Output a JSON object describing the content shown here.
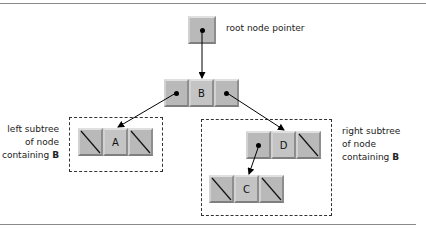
{
  "diagram": {
    "type": "binary-tree-linked-representation",
    "root_pointer": {
      "label": "root node pointer"
    },
    "nodes": {
      "B": {
        "value": "B",
        "left": "pointer",
        "right": "pointer"
      },
      "A": {
        "value": "A",
        "left": "null",
        "right": "null"
      },
      "D": {
        "value": "D",
        "left": "pointer",
        "right": "null"
      },
      "C": {
        "value": "C",
        "left": "null",
        "right": "null"
      }
    },
    "edges": [
      {
        "from": "root",
        "to": "B"
      },
      {
        "from": "B.left",
        "to": "A"
      },
      {
        "from": "B.right",
        "to": "D"
      },
      {
        "from": "D.left",
        "to": "C"
      }
    ],
    "left_subtree": {
      "line1": "left subtree",
      "line2": "of node",
      "line3_prefix": "containing ",
      "line3_bold": "B"
    },
    "right_subtree": {
      "line1": "right subtree",
      "line2": "of node",
      "line3_prefix": "containing ",
      "line3_bold": "B"
    }
  },
  "colors": {
    "cell": "#b9b9b9",
    "dashed_border": "#333333",
    "rule": "#8a8a8a"
  }
}
